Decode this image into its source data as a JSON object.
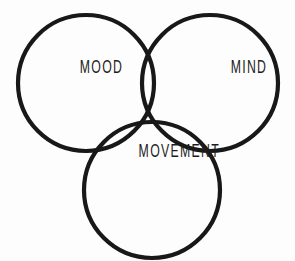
{
  "diagram": {
    "type": "venn",
    "set_count": 3,
    "title": "",
    "background_color": "#fdfdfd",
    "stroke_color": "#181818",
    "label_color": "#1d1d1d",
    "stroke_width": 4.2,
    "clipped_header_text": "",
    "circles": [
      {
        "id": "mood",
        "label": "MOOD",
        "cx": 86,
        "cy": 83,
        "r": 68,
        "label_x": 86,
        "label_y": 83
      },
      {
        "id": "mind",
        "label": "MIND",
        "cx": 210,
        "cy": 83,
        "r": 68,
        "label_x": 211,
        "label_y": 83
      },
      {
        "id": "movement",
        "label": "MOVEMENT",
        "cx": 152,
        "cy": 190,
        "r": 68,
        "label_x": 152,
        "label_y": 185
      }
    ]
  }
}
